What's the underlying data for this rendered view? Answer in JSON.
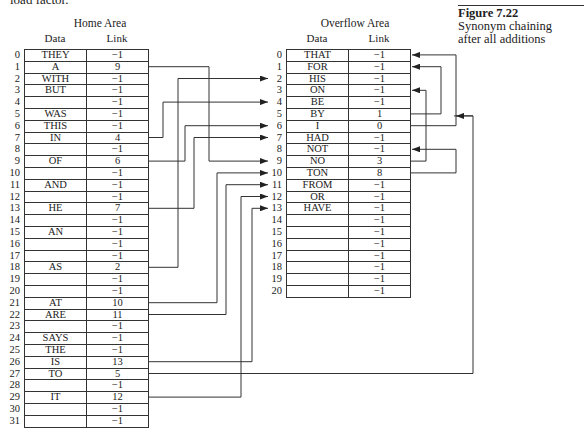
{
  "page": {
    "cut_text": "load factor."
  },
  "figure": {
    "label": "Figure 7.22",
    "caption_line1": "Synonym chaining",
    "caption_line2": "after all additions"
  },
  "home": {
    "title": "Home Area",
    "col_data": "Data",
    "col_link": "Link",
    "rows": [
      {
        "i": "0",
        "data": "THEY",
        "link": "−1"
      },
      {
        "i": "1",
        "data": "A",
        "link": "9"
      },
      {
        "i": "2",
        "data": "WITH",
        "link": "−1"
      },
      {
        "i": "3",
        "data": "BUT",
        "link": "−1"
      },
      {
        "i": "4",
        "data": "",
        "link": "−1"
      },
      {
        "i": "5",
        "data": "WAS",
        "link": "−1"
      },
      {
        "i": "6",
        "data": "THIS",
        "link": "−1"
      },
      {
        "i": "7",
        "data": "IN",
        "link": "4"
      },
      {
        "i": "8",
        "data": "",
        "link": "−1"
      },
      {
        "i": "9",
        "data": "OF",
        "link": "6"
      },
      {
        "i": "10",
        "data": "",
        "link": "−1"
      },
      {
        "i": "11",
        "data": "AND",
        "link": "−1"
      },
      {
        "i": "12",
        "data": "",
        "link": "−1"
      },
      {
        "i": "13",
        "data": "HE",
        "link": "7"
      },
      {
        "i": "14",
        "data": "",
        "link": "−1"
      },
      {
        "i": "15",
        "data": "AN",
        "link": "−1"
      },
      {
        "i": "16",
        "data": "",
        "link": "−1"
      },
      {
        "i": "17",
        "data": "",
        "link": "−1"
      },
      {
        "i": "18",
        "data": "AS",
        "link": "2"
      },
      {
        "i": "19",
        "data": "",
        "link": "−1"
      },
      {
        "i": "20",
        "data": "",
        "link": "−1"
      },
      {
        "i": "21",
        "data": "AT",
        "link": "10"
      },
      {
        "i": "22",
        "data": "ARE",
        "link": "11"
      },
      {
        "i": "23",
        "data": "",
        "link": "−1"
      },
      {
        "i": "24",
        "data": "SAYS",
        "link": "−1"
      },
      {
        "i": "25",
        "data": "THE",
        "link": "−1"
      },
      {
        "i": "26",
        "data": "IS",
        "link": "13"
      },
      {
        "i": "27",
        "data": "TO",
        "link": "5"
      },
      {
        "i": "28",
        "data": "",
        "link": "−1"
      },
      {
        "i": "29",
        "data": "IT",
        "link": "12"
      },
      {
        "i": "30",
        "data": "",
        "link": "−1"
      },
      {
        "i": "31",
        "data": "",
        "link": "−1"
      }
    ]
  },
  "overflow": {
    "title": "Overflow Area",
    "col_data": "Data",
    "col_link": "Link",
    "rows": [
      {
        "i": "0",
        "data": "THAT",
        "link": "−1"
      },
      {
        "i": "1",
        "data": "FOR",
        "link": "−1"
      },
      {
        "i": "2",
        "data": "HIS",
        "link": "−1"
      },
      {
        "i": "3",
        "data": "ON",
        "link": "−1"
      },
      {
        "i": "4",
        "data": "BE",
        "link": "−1"
      },
      {
        "i": "5",
        "data": "BY",
        "link": "1"
      },
      {
        "i": "6",
        "data": "I",
        "link": "0"
      },
      {
        "i": "7",
        "data": "HAD",
        "link": "−1"
      },
      {
        "i": "8",
        "data": "NOT",
        "link": "−1"
      },
      {
        "i": "9",
        "data": "NO",
        "link": "3"
      },
      {
        "i": "10",
        "data": "TON",
        "link": "8"
      },
      {
        "i": "11",
        "data": "FROM",
        "link": "−1"
      },
      {
        "i": "12",
        "data": "OR",
        "link": "−1"
      },
      {
        "i": "13",
        "data": "HAVE",
        "link": "−1"
      },
      {
        "i": "14",
        "data": "",
        "link": "−1"
      },
      {
        "i": "15",
        "data": "",
        "link": "−1"
      },
      {
        "i": "16",
        "data": "",
        "link": "−1"
      },
      {
        "i": "17",
        "data": "",
        "link": "−1"
      },
      {
        "i": "18",
        "data": "",
        "link": "−1"
      },
      {
        "i": "19",
        "data": "",
        "link": "−1"
      },
      {
        "i": "20",
        "data": "",
        "link": "−1"
      }
    ]
  }
}
